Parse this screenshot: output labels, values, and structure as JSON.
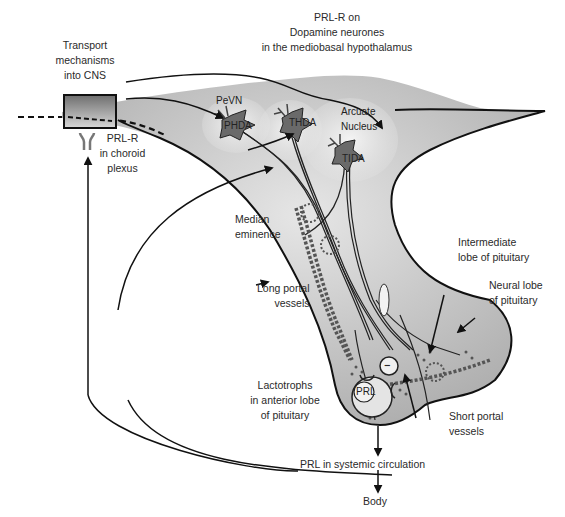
{
  "diagram": {
    "title_labels": {
      "prl_r_dopamine": [
        "PRL-R on",
        "Dopamine neurones",
        "in the mediobasal hypothalamus"
      ],
      "transport": [
        "Transport",
        "mechanisms",
        "into CNS"
      ],
      "prl_r_choroid": [
        "PRL-R",
        "in choroid",
        "plexus"
      ]
    },
    "nuclei": {
      "pevn": "PeVN",
      "arcuate": [
        "Arcuate",
        "Nucleus"
      ]
    },
    "neurons": {
      "phda": "PHDA",
      "thda": "THDA",
      "tida": "TIDA"
    },
    "structures": {
      "median_eminence": [
        "Median",
        "eminence"
      ],
      "long_portal": [
        "Long portal",
        "vessels"
      ],
      "intermediate_lobe": [
        "Intermediate",
        "lobe of pituitary"
      ],
      "neural_lobe": [
        "Neural lobe",
        "of pituitary"
      ],
      "lactotrophs": [
        "Lactotrophs",
        "in anterior lobe",
        "of pituitary"
      ],
      "short_portal": [
        "Short portal",
        "vessels"
      ],
      "prl_cell": "PRL",
      "inhibition_sign": "−"
    },
    "flow": {
      "systemic": "PRL in systemic circulation",
      "body": "Body"
    },
    "colors": {
      "tissue": "#c4c4c4",
      "tissue_light": "#e8e8e8",
      "neuron": "#6a6a6a",
      "line": "#1a1a1a"
    }
  }
}
